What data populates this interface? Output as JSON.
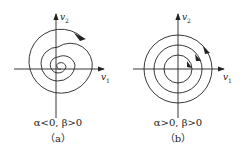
{
  "panels": [
    {
      "id": "a",
      "condition": "α<0, β>0",
      "caption": "（a）",
      "axis_x_label": "v",
      "axis_x_sub": "1",
      "axis_y_label": "v",
      "axis_y_sub": "2",
      "curve": "spiral converging to origin (stable focus)"
    },
    {
      "id": "b",
      "condition": "α>0, β>0",
      "caption": "（b）",
      "axis_x_label": "v",
      "axis_x_sub": "1",
      "axis_y_label": "v",
      "axis_y_sub": "2",
      "curve": "three concentric circles (center)"
    }
  ],
  "colors": {
    "stroke": "#222222",
    "background": "#ffffff"
  }
}
